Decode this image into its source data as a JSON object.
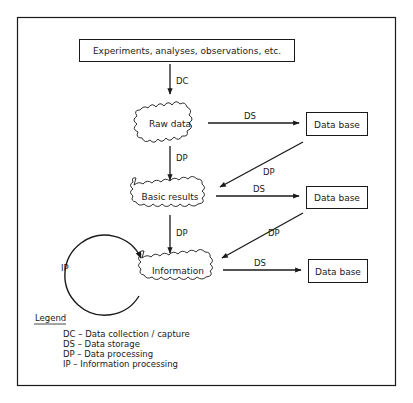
{
  "source_box": {
    "label": "Experiments, analyses, observations, etc."
  },
  "nodes": {
    "raw_data": "Raw data",
    "basic_results": "Basic results",
    "information": "Information"
  },
  "databases": [
    {
      "label": "Data base"
    },
    {
      "label": "Data base"
    },
    {
      "label": "Data base"
    }
  ],
  "edges": {
    "source_to_raw": "DC",
    "raw_to_db1": "DS",
    "raw_to_basic": "DP",
    "db1_to_basic": "DP",
    "basic_to_db2": "DS",
    "basic_to_info": "DP",
    "db2_to_info": "DP",
    "info_to_db3": "DS",
    "info_loop": "IP"
  },
  "legend": {
    "title": "Legend",
    "items": [
      "DC – Data collection / capture",
      "DS – Data storage",
      "DP – Data processing",
      "IP – Information processing"
    ]
  },
  "colors": {
    "stroke": "#1a1a1a",
    "background": "#ffffff"
  }
}
